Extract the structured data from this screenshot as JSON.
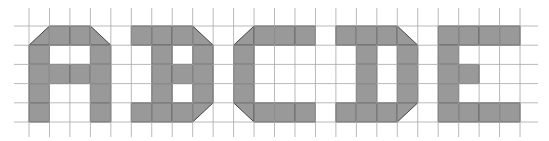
{
  "diagram": {
    "title": "Pixel grid letters",
    "grid": {
      "x0": 29,
      "col_width": 20.46,
      "columns": 24,
      "y0": 26,
      "row_height": 19.2,
      "rows": 5,
      "line_x_start": 14,
      "line_x_end": 538,
      "line_y_start": 8,
      "line_y_end": 137,
      "line_color": "#a8a8a8"
    },
    "colors": {
      "fill": "#999999",
      "outline": "#333333",
      "background": "#ffffff"
    },
    "letters": [
      {
        "label": "A",
        "cells": [
          {
            "r": 0,
            "c": 0,
            "t": "br"
          },
          {
            "r": 0,
            "c": 1
          },
          {
            "r": 0,
            "c": 2
          },
          {
            "r": 0,
            "c": 3,
            "t": "bl"
          },
          {
            "r": 1,
            "c": 0
          },
          {
            "r": 1,
            "c": 3
          },
          {
            "r": 2,
            "c": 0
          },
          {
            "r": 2,
            "c": 1
          },
          {
            "r": 2,
            "c": 2
          },
          {
            "r": 2,
            "c": 3
          },
          {
            "r": 3,
            "c": 0
          },
          {
            "r": 3,
            "c": 3
          },
          {
            "r": 4,
            "c": 0
          },
          {
            "r": 4,
            "c": 3
          }
        ]
      },
      {
        "label": "B",
        "cells": [
          {
            "r": 0,
            "c": 5
          },
          {
            "r": 0,
            "c": 6
          },
          {
            "r": 0,
            "c": 7
          },
          {
            "r": 0,
            "c": 8,
            "t": "bl"
          },
          {
            "r": 1,
            "c": 6
          },
          {
            "r": 1,
            "c": 8
          },
          {
            "r": 2,
            "c": 6
          },
          {
            "r": 2,
            "c": 7
          },
          {
            "r": 2,
            "c": 8
          },
          {
            "r": 3,
            "c": 6
          },
          {
            "r": 3,
            "c": 8
          },
          {
            "r": 4,
            "c": 5
          },
          {
            "r": 4,
            "c": 6
          },
          {
            "r": 4,
            "c": 7
          },
          {
            "r": 4,
            "c": 8,
            "t": "tl"
          }
        ]
      },
      {
        "label": "C",
        "cells": [
          {
            "r": 0,
            "c": 10,
            "t": "br"
          },
          {
            "r": 0,
            "c": 11
          },
          {
            "r": 0,
            "c": 12
          },
          {
            "r": 0,
            "c": 13
          },
          {
            "r": 1,
            "c": 10
          },
          {
            "r": 2,
            "c": 10
          },
          {
            "r": 3,
            "c": 10
          },
          {
            "r": 4,
            "c": 10,
            "t": "tr"
          },
          {
            "r": 4,
            "c": 11
          },
          {
            "r": 4,
            "c": 12
          },
          {
            "r": 4,
            "c": 13
          }
        ]
      },
      {
        "label": "D",
        "cells": [
          {
            "r": 0,
            "c": 15
          },
          {
            "r": 0,
            "c": 16
          },
          {
            "r": 0,
            "c": 17
          },
          {
            "r": 0,
            "c": 18,
            "t": "bl"
          },
          {
            "r": 1,
            "c": 16
          },
          {
            "r": 1,
            "c": 18
          },
          {
            "r": 2,
            "c": 16
          },
          {
            "r": 2,
            "c": 18
          },
          {
            "r": 3,
            "c": 16
          },
          {
            "r": 3,
            "c": 18
          },
          {
            "r": 4,
            "c": 15
          },
          {
            "r": 4,
            "c": 16
          },
          {
            "r": 4,
            "c": 17
          },
          {
            "r": 4,
            "c": 18,
            "t": "tl"
          }
        ]
      },
      {
        "label": "E",
        "cells": [
          {
            "r": 0,
            "c": 20
          },
          {
            "r": 0,
            "c": 21
          },
          {
            "r": 0,
            "c": 22
          },
          {
            "r": 0,
            "c": 23
          },
          {
            "r": 1,
            "c": 20
          },
          {
            "r": 2,
            "c": 20
          },
          {
            "r": 2,
            "c": 21
          },
          {
            "r": 3,
            "c": 20
          },
          {
            "r": 4,
            "c": 20
          },
          {
            "r": 4,
            "c": 21
          },
          {
            "r": 4,
            "c": 22
          },
          {
            "r": 4,
            "c": 23
          }
        ]
      }
    ]
  }
}
